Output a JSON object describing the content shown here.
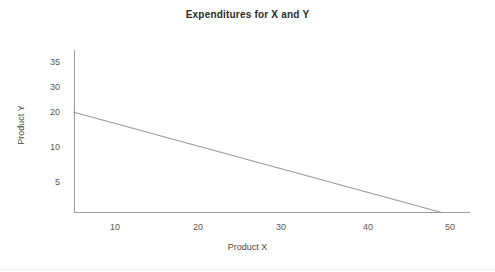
{
  "chart_data": {
    "type": "line",
    "title": "Expenditures for X and Y",
    "xlabel": "Product X",
    "ylabel": "Product Y",
    "grid": false,
    "legend": "none",
    "xlim": [
      5,
      52.8
    ],
    "ylim": [
      0,
      38
    ],
    "xticks": [
      10,
      20,
      30,
      40,
      50
    ],
    "xtick_labels": [
      "10",
      "20",
      "30",
      "40",
      "50"
    ],
    "yticks": [
      35,
      30,
      20,
      10,
      5
    ],
    "ytick_labels": [
      "35",
      "30",
      "20",
      "10",
      "5"
    ],
    "series": [
      {
        "name": "Budget constraint",
        "color": "#9a9a9a",
        "x": [
          5,
          49
        ],
        "y": [
          22,
          0
        ]
      }
    ]
  },
  "axes": {
    "x_axis_name": "x-axis-line",
    "y_axis_name": "y-axis-line"
  }
}
